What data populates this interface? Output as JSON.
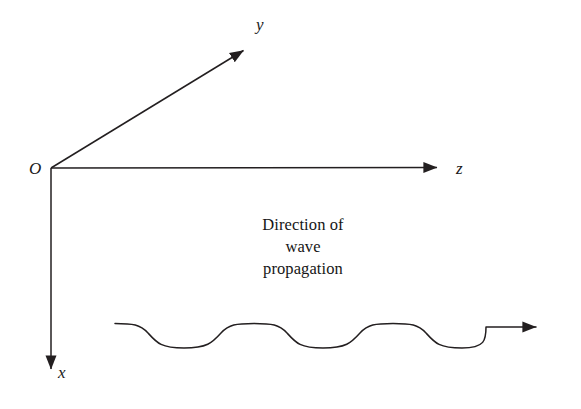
{
  "figure": {
    "type": "physics-axes-wave-diagram",
    "background_color": "#ffffff",
    "stroke_color": "#231f20",
    "width": 581,
    "height": 409
  },
  "axes": {
    "origin_label": "O",
    "items": [
      {
        "id": "y",
        "label": "y",
        "direction": "up-right",
        "from": [
          51,
          168
        ],
        "to": [
          248,
          48
        ]
      },
      {
        "id": "z",
        "label": "z",
        "direction": "right",
        "from": [
          51,
          168
        ],
        "to": [
          450,
          167
        ]
      },
      {
        "id": "x",
        "label": "x",
        "direction": "down",
        "from": [
          51,
          168
        ],
        "to": [
          51,
          382
        ]
      }
    ]
  },
  "caption": {
    "lines": [
      "Direction of",
      "wave",
      "propagation"
    ],
    "line1": "Direction of",
    "line2": "wave",
    "line3": "propagation"
  },
  "wave": {
    "description": "flattened sinusoid travelling along z with terminal arrow",
    "start": [
      115,
      324
    ],
    "crest_y": 324,
    "trough_y": 348,
    "period_px": 105,
    "cycles": 3.5,
    "arrow_tip": [
      549,
      327
    ]
  }
}
